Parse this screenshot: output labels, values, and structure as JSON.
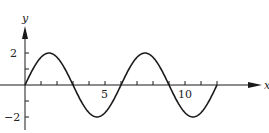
{
  "chart_data": {
    "type": "line",
    "title": "",
    "xlabel": "x",
    "ylabel": "y",
    "function": "y = 2 sin(pi x / 3)",
    "xlim": [
      0,
      12
    ],
    "ylim": [
      -2,
      2
    ],
    "grid": false,
    "legend": null,
    "x_ticks": [
      0,
      1,
      2,
      3,
      4,
      5,
      6,
      7,
      8,
      9,
      10,
      11,
      12
    ],
    "x_tick_labels": {
      "5": "5",
      "10": "10"
    },
    "y_ticks": [
      -2,
      -1,
      0,
      1,
      2
    ],
    "y_tick_labels": {
      "2": "2",
      "-2": "−2"
    },
    "series": [
      {
        "name": "curve",
        "x": [
          0,
          0.5,
          1,
          1.5,
          2,
          2.5,
          3,
          3.5,
          4,
          4.5,
          5,
          5.5,
          6,
          6.5,
          7,
          7.5,
          8,
          8.5,
          9,
          9.5,
          10,
          10.5,
          11,
          11.5,
          12
        ],
        "y": [
          0,
          1.0,
          1.73,
          2.0,
          1.73,
          1.0,
          0,
          -1.0,
          -1.73,
          -2.0,
          -1.73,
          -1.0,
          0,
          1.0,
          1.73,
          2.0,
          1.73,
          1.0,
          0,
          -1.0,
          -1.73,
          -2.0,
          -1.73,
          -1.0,
          0
        ]
      }
    ]
  },
  "axes": {
    "x_label": "x",
    "y_label": "y",
    "x_tick_5": "5",
    "x_tick_10": "10",
    "y_tick_2": "2",
    "y_tick_neg2": "−2"
  },
  "colors": {
    "ink": "#1a1a1a",
    "background": "#ffffff"
  }
}
